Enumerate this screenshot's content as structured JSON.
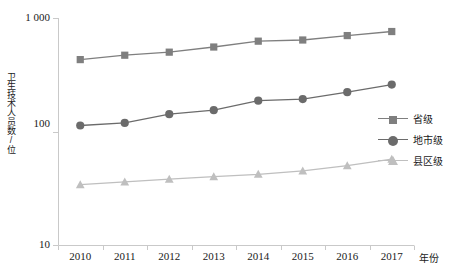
{
  "chart_data": {
    "type": "line",
    "title": "",
    "xlabel": "年份",
    "ylabel": "卫生技术人员数/位",
    "x": [
      2010,
      2011,
      2012,
      2013,
      2014,
      2015,
      2016,
      2017
    ],
    "xtick_labels": [
      "2010",
      "2011",
      "2012",
      "2013",
      "2014",
      "2015",
      "2016",
      "2017"
    ],
    "yscale": "log",
    "ylim": [
      10,
      1000
    ],
    "ytick_labels": [
      "1 000",
      "100",
      "10"
    ],
    "ytick_values": [
      1000,
      100,
      10
    ],
    "grid": false,
    "legend_position": "right",
    "series": [
      {
        "name": "省级",
        "marker": "square",
        "color": "#7f7f7f",
        "values": [
          430,
          470,
          500,
          555,
          625,
          640,
          700,
          760
        ]
      },
      {
        "name": "地市级",
        "marker": "circle",
        "color": "#6b6b6b",
        "values": [
          113,
          119,
          142,
          154,
          187,
          193,
          222,
          259
        ]
      },
      {
        "name": "县区级",
        "marker": "triangle",
        "color": "#bfbfbf",
        "values": [
          34,
          36,
          38,
          40,
          42,
          45,
          50,
          57
        ]
      }
    ]
  },
  "axis": {
    "line_color": "#c9c9c9",
    "tick_color": "#c9c9c9"
  },
  "legend": {
    "items": [
      {
        "label": "省级",
        "marker": "square",
        "color": "#7f7f7f"
      },
      {
        "label": "地市级",
        "marker": "circle",
        "color": "#6b6b6b"
      },
      {
        "label": "县区级",
        "marker": "triangle",
        "color": "#bfbfbf"
      }
    ]
  }
}
